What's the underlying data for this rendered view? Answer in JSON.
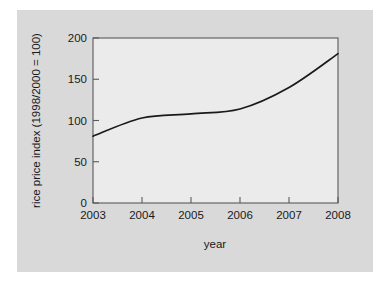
{
  "figure": {
    "background_color": "#ffffff",
    "panel_color": "#d9d9d9",
    "plot_area_color": "#ebebeb",
    "line_color": "#1a1a1a",
    "axis_color": "#555555"
  },
  "chart_data": {
    "type": "line",
    "title": "",
    "subtitle": "",
    "xlabel": "year",
    "ylabel": "rice price index (1998/2000 = 100)",
    "x": [
      2003,
      2004,
      2005,
      2006,
      2007,
      2008
    ],
    "categories": [
      "2003",
      "2004",
      "2005",
      "2006",
      "2007",
      "2008"
    ],
    "values": [
      81,
      103,
      108,
      114,
      140,
      181
    ],
    "series": [
      {
        "name": "rice price index",
        "values": [
          81,
          103,
          108,
          114,
          140,
          181
        ]
      }
    ],
    "xlim": [
      2003,
      2008
    ],
    "ylim": [
      0,
      200
    ],
    "xticks": [
      2003,
      2004,
      2005,
      2006,
      2007,
      2008
    ],
    "xtick_labels": [
      "2003",
      "2004",
      "2005",
      "2006",
      "2007",
      "2008"
    ],
    "yticks": [
      0,
      50,
      100,
      150,
      200
    ],
    "ytick_labels": [
      "0",
      "50",
      "100",
      "150",
      "200"
    ],
    "grid": false,
    "legend": false,
    "legend_position": "none",
    "annotations": []
  },
  "axes": {
    "y_tick_labels": [
      "200",
      "150",
      "100",
      "50",
      "0"
    ],
    "x_tick_labels": [
      "2003",
      "2004",
      "2005",
      "2006",
      "2007",
      "2008"
    ],
    "y_axis_title": "rice price index (1998/2000 = 100)",
    "x_axis_title": "year"
  }
}
